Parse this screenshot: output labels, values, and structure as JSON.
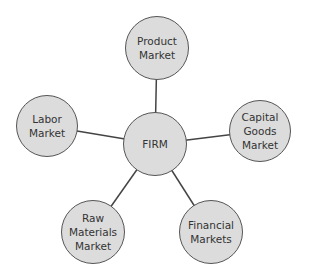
{
  "diagram": {
    "center": {
      "id": "firm",
      "label": "FIRM",
      "cx": 155,
      "cy": 144,
      "r": 32
    },
    "nodes": [
      {
        "id": "product",
        "label": "Product\nMarket",
        "cx": 157,
        "cy": 48,
        "r": 32
      },
      {
        "id": "capital",
        "label": "Capital\nGoods\nMarket",
        "cx": 260,
        "cy": 131,
        "r": 31
      },
      {
        "id": "financial",
        "label": "Financial\nMarkets",
        "cx": 211,
        "cy": 232,
        "r": 32
      },
      {
        "id": "raw",
        "label": "Raw\nMaterials\nMarket",
        "cx": 93,
        "cy": 232,
        "r": 32
      },
      {
        "id": "labor",
        "label": "Labor\nMarket",
        "cx": 47,
        "cy": 126,
        "r": 31
      }
    ],
    "colors": {
      "fill": "#dcdcdc",
      "stroke": "#555555",
      "text": "#333333",
      "edge": "#444444"
    }
  }
}
